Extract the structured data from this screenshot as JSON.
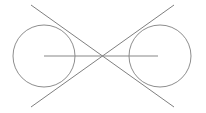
{
  "figure": {
    "canvas": {
      "width": 206,
      "height": 113,
      "background_color": "#ffffff"
    },
    "stroke": {
      "circle_color": "#808080",
      "tangent_color": "#707070",
      "axis_color": "#888888",
      "circle_width": 0.9,
      "tangent_width": 0.9,
      "axis_width": 1.2
    },
    "circles": [
      {
        "name": "left-circle",
        "cx": 44,
        "cy": 56,
        "r": 31
      },
      {
        "name": "right-circle",
        "cx": 160,
        "cy": 56,
        "r": 31
      }
    ],
    "crossing_point": {
      "name": "tangent-intersection",
      "x": 102,
      "y": 56
    },
    "tangent_lines": [
      {
        "name": "tangent-upper-left-to-lower-right",
        "x1": 31,
        "y1": 5,
        "x2": 174,
        "y2": 107
      },
      {
        "name": "tangent-lower-left-to-upper-right",
        "x1": 31,
        "y1": 107,
        "x2": 174,
        "y2": 5
      }
    ],
    "center_line": {
      "name": "center-axis-line",
      "x1": 44,
      "y1": 56,
      "x2": 158,
      "y2": 56
    }
  }
}
